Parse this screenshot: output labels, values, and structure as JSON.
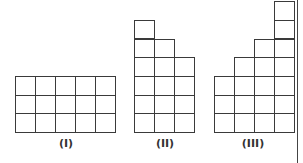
{
  "figures": [
    {
      "label": "(I)",
      "columns": [
        3,
        3,
        3,
        3,
        3
      ],
      "left": 15,
      "bottom": 132,
      "label_x": 46
    },
    {
      "label": "(II)",
      "columns": [
        6,
        5,
        4
      ],
      "left": 134,
      "bottom": 132,
      "label_x": 145
    },
    {
      "label": "(III)",
      "columns": [
        3,
        4,
        5,
        7
      ],
      "left": 214,
      "bottom": 132,
      "label_x": 233
    }
  ],
  "cell_w": 20,
  "cell_h": 18.7,
  "label_y": 137,
  "line_color": "#3a3a3a"
}
